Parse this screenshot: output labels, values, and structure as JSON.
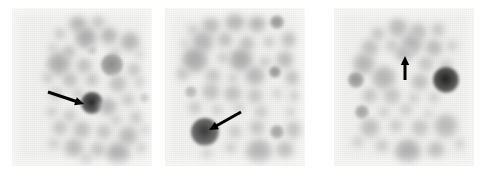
{
  "figure": {
    "kind": "autoradiograph-colony-blot",
    "width": 486,
    "height": 175,
    "background_color": "#ffffff",
    "panel_background_color": "#f2f2f0",
    "spot_color": "#808080",
    "arrow_color": "#000000",
    "panel_count": 3
  },
  "panels": [
    {
      "id": "panel-1",
      "label": "",
      "x": 12,
      "y": 8,
      "width": 140,
      "height": 158,
      "arrow": {
        "name": "arrow-annotation-1",
        "direction": "right-down",
        "tail": [
          36,
          84
        ],
        "tip": [
          72,
          96
        ],
        "length": 38
      },
      "spots": [
        {
          "cx": 66,
          "cy": 16,
          "r": 9,
          "tone": 0.3,
          "blur": "soft"
        },
        {
          "cx": 86,
          "cy": 14,
          "r": 7,
          "tone": 0.24,
          "blur": "soft"
        },
        {
          "cx": 48,
          "cy": 26,
          "r": 6,
          "tone": 0.22,
          "blur": "soft"
        },
        {
          "cx": 74,
          "cy": 30,
          "r": 11,
          "tone": 0.34,
          "blur": "soft"
        },
        {
          "cx": 97,
          "cy": 28,
          "r": 9,
          "tone": 0.3,
          "blur": "soft"
        },
        {
          "cx": 118,
          "cy": 34,
          "r": 10,
          "tone": 0.3,
          "blur": "soft"
        },
        {
          "cx": 41,
          "cy": 40,
          "r": 5,
          "tone": 0.2,
          "blur": "soft"
        },
        {
          "cx": 57,
          "cy": 44,
          "r": 7,
          "tone": 0.26,
          "blur": "soft"
        },
        {
          "cx": 80,
          "cy": 42,
          "r": 5,
          "tone": 0.22,
          "blur": "sharp"
        },
        {
          "cx": 103,
          "cy": 45,
          "r": 6,
          "tone": 0.2,
          "blur": "soft"
        },
        {
          "cx": 128,
          "cy": 46,
          "r": 5,
          "tone": 0.18,
          "blur": "soft"
        },
        {
          "cx": 47,
          "cy": 56,
          "r": 12,
          "tone": 0.33,
          "blur": "soft"
        },
        {
          "cx": 72,
          "cy": 58,
          "r": 8,
          "tone": 0.26,
          "blur": "soft"
        },
        {
          "cx": 100,
          "cy": 57,
          "r": 11,
          "tone": 0.45,
          "blur": "sharp"
        },
        {
          "cx": 122,
          "cy": 62,
          "r": 7,
          "tone": 0.24,
          "blur": "soft"
        },
        {
          "cx": 36,
          "cy": 70,
          "r": 6,
          "tone": 0.22,
          "blur": "soft"
        },
        {
          "cx": 58,
          "cy": 72,
          "r": 8,
          "tone": 0.26,
          "blur": "soft"
        },
        {
          "cx": 80,
          "cy": 72,
          "r": 7,
          "tone": 0.24,
          "blur": "soft"
        },
        {
          "cx": 106,
          "cy": 76,
          "r": 9,
          "tone": 0.26,
          "blur": "soft"
        },
        {
          "cx": 128,
          "cy": 74,
          "r": 6,
          "tone": 0.2,
          "blur": "soft"
        },
        {
          "cx": 44,
          "cy": 86,
          "r": 7,
          "tone": 0.22,
          "blur": "soft"
        },
        {
          "cx": 66,
          "cy": 86,
          "r": 6,
          "tone": 0.22,
          "blur": "soft"
        },
        {
          "cx": 80,
          "cy": 95,
          "r": 11,
          "tone": 0.85,
          "blur": "sharp"
        },
        {
          "cx": 96,
          "cy": 99,
          "r": 9,
          "tone": 0.3,
          "blur": "soft"
        },
        {
          "cx": 116,
          "cy": 92,
          "r": 7,
          "tone": 0.22,
          "blur": "soft"
        },
        {
          "cx": 133,
          "cy": 90,
          "r": 5,
          "tone": 0.24,
          "blur": "sharp"
        },
        {
          "cx": 40,
          "cy": 104,
          "r": 6,
          "tone": 0.2,
          "blur": "soft"
        },
        {
          "cx": 58,
          "cy": 108,
          "r": 7,
          "tone": 0.22,
          "blur": "soft"
        },
        {
          "cx": 104,
          "cy": 112,
          "r": 6,
          "tone": 0.2,
          "blur": "soft"
        },
        {
          "cx": 124,
          "cy": 110,
          "r": 7,
          "tone": 0.22,
          "blur": "soft"
        },
        {
          "cx": 48,
          "cy": 120,
          "r": 8,
          "tone": 0.24,
          "blur": "soft"
        },
        {
          "cx": 70,
          "cy": 122,
          "r": 9,
          "tone": 0.26,
          "blur": "soft"
        },
        {
          "cx": 92,
          "cy": 124,
          "r": 8,
          "tone": 0.24,
          "blur": "soft"
        },
        {
          "cx": 116,
          "cy": 128,
          "r": 10,
          "tone": 0.28,
          "blur": "soft"
        },
        {
          "cx": 134,
          "cy": 122,
          "r": 6,
          "tone": 0.2,
          "blur": "soft"
        },
        {
          "cx": 42,
          "cy": 136,
          "r": 6,
          "tone": 0.2,
          "blur": "soft"
        },
        {
          "cx": 62,
          "cy": 140,
          "r": 10,
          "tone": 0.28,
          "blur": "soft"
        },
        {
          "cx": 86,
          "cy": 142,
          "r": 8,
          "tone": 0.24,
          "blur": "soft"
        },
        {
          "cx": 106,
          "cy": 146,
          "r": 12,
          "tone": 0.32,
          "blur": "soft"
        },
        {
          "cx": 130,
          "cy": 140,
          "r": 6,
          "tone": 0.2,
          "blur": "soft"
        },
        {
          "cx": 74,
          "cy": 152,
          "r": 7,
          "tone": 0.22,
          "blur": "soft"
        }
      ]
    },
    {
      "id": "panel-2",
      "label": "",
      "x": 165,
      "y": 8,
      "width": 140,
      "height": 158,
      "arrow": {
        "name": "arrow-annotation-2",
        "direction": "left-down",
        "tail": [
          76,
          104
        ],
        "tip": [
          44,
          122
        ],
        "length": 37
      },
      "spots": [
        {
          "cx": 28,
          "cy": 22,
          "r": 6,
          "tone": 0.2,
          "blur": "soft"
        },
        {
          "cx": 46,
          "cy": 18,
          "r": 9,
          "tone": 0.28,
          "blur": "soft"
        },
        {
          "cx": 70,
          "cy": 14,
          "r": 10,
          "tone": 0.3,
          "blur": "soft"
        },
        {
          "cx": 92,
          "cy": 16,
          "r": 9,
          "tone": 0.3,
          "blur": "soft"
        },
        {
          "cx": 112,
          "cy": 14,
          "r": 7,
          "tone": 0.42,
          "blur": "sharp"
        },
        {
          "cx": 20,
          "cy": 36,
          "r": 5,
          "tone": 0.18,
          "blur": "soft"
        },
        {
          "cx": 38,
          "cy": 34,
          "r": 11,
          "tone": 0.3,
          "blur": "soft"
        },
        {
          "cx": 60,
          "cy": 32,
          "r": 8,
          "tone": 0.26,
          "blur": "soft"
        },
        {
          "cx": 82,
          "cy": 36,
          "r": 8,
          "tone": 0.26,
          "blur": "soft"
        },
        {
          "cx": 104,
          "cy": 34,
          "r": 6,
          "tone": 0.22,
          "blur": "soft"
        },
        {
          "cx": 124,
          "cy": 32,
          "r": 8,
          "tone": 0.26,
          "blur": "soft"
        },
        {
          "cx": 30,
          "cy": 52,
          "r": 13,
          "tone": 0.34,
          "blur": "soft"
        },
        {
          "cx": 58,
          "cy": 50,
          "r": 6,
          "tone": 0.22,
          "blur": "soft"
        },
        {
          "cx": 76,
          "cy": 52,
          "r": 12,
          "tone": 0.34,
          "blur": "soft"
        },
        {
          "cx": 100,
          "cy": 54,
          "r": 6,
          "tone": 0.22,
          "blur": "soft"
        },
        {
          "cx": 120,
          "cy": 52,
          "r": 9,
          "tone": 0.28,
          "blur": "soft"
        },
        {
          "cx": 18,
          "cy": 66,
          "r": 7,
          "tone": 0.24,
          "blur": "soft"
        },
        {
          "cx": 48,
          "cy": 68,
          "r": 8,
          "tone": 0.24,
          "blur": "soft"
        },
        {
          "cx": 68,
          "cy": 70,
          "r": 6,
          "tone": 0.2,
          "blur": "soft"
        },
        {
          "cx": 90,
          "cy": 68,
          "r": 10,
          "tone": 0.3,
          "blur": "soft"
        },
        {
          "cx": 110,
          "cy": 64,
          "r": 6,
          "tone": 0.42,
          "blur": "sharp"
        },
        {
          "cx": 128,
          "cy": 70,
          "r": 8,
          "tone": 0.26,
          "blur": "soft"
        },
        {
          "cx": 26,
          "cy": 84,
          "r": 6,
          "tone": 0.28,
          "blur": "sharp"
        },
        {
          "cx": 46,
          "cy": 84,
          "r": 9,
          "tone": 0.26,
          "blur": "soft"
        },
        {
          "cx": 68,
          "cy": 86,
          "r": 9,
          "tone": 0.26,
          "blur": "soft"
        },
        {
          "cx": 90,
          "cy": 88,
          "r": 8,
          "tone": 0.24,
          "blur": "soft"
        },
        {
          "cx": 112,
          "cy": 86,
          "r": 5,
          "tone": 0.2,
          "blur": "soft"
        },
        {
          "cx": 130,
          "cy": 88,
          "r": 6,
          "tone": 0.22,
          "blur": "soft"
        },
        {
          "cx": 30,
          "cy": 100,
          "r": 7,
          "tone": 0.22,
          "blur": "soft"
        },
        {
          "cx": 52,
          "cy": 102,
          "r": 6,
          "tone": 0.2,
          "blur": "soft"
        },
        {
          "cx": 74,
          "cy": 100,
          "r": 6,
          "tone": 0.2,
          "blur": "soft"
        },
        {
          "cx": 96,
          "cy": 104,
          "r": 7,
          "tone": 0.22,
          "blur": "soft"
        },
        {
          "cx": 126,
          "cy": 104,
          "r": 5,
          "tone": 0.2,
          "blur": "soft"
        },
        {
          "cx": 40,
          "cy": 124,
          "r": 14,
          "tone": 0.78,
          "blur": "sharp"
        },
        {
          "cx": 70,
          "cy": 124,
          "r": 7,
          "tone": 0.22,
          "blur": "soft"
        },
        {
          "cx": 92,
          "cy": 120,
          "r": 8,
          "tone": 0.24,
          "blur": "soft"
        },
        {
          "cx": 112,
          "cy": 124,
          "r": 7,
          "tone": 0.36,
          "blur": "sharp"
        },
        {
          "cx": 130,
          "cy": 122,
          "r": 9,
          "tone": 0.26,
          "blur": "soft"
        },
        {
          "cx": 66,
          "cy": 140,
          "r": 6,
          "tone": 0.2,
          "blur": "soft"
        },
        {
          "cx": 94,
          "cy": 144,
          "r": 13,
          "tone": 0.3,
          "blur": "soft"
        },
        {
          "cx": 120,
          "cy": 142,
          "r": 9,
          "tone": 0.26,
          "blur": "soft"
        },
        {
          "cx": 42,
          "cy": 146,
          "r": 6,
          "tone": 0.18,
          "blur": "soft"
        }
      ]
    },
    {
      "id": "panel-3",
      "label": "",
      "x": 334,
      "y": 8,
      "width": 140,
      "height": 158,
      "arrow": {
        "name": "arrow-annotation-3",
        "direction": "up",
        "tail": [
          71,
          72
        ],
        "tip": [
          71,
          48
        ],
        "length": 24
      },
      "spots": [
        {
          "cx": 44,
          "cy": 26,
          "r": 7,
          "tone": 0.24,
          "blur": "soft"
        },
        {
          "cx": 64,
          "cy": 20,
          "r": 10,
          "tone": 0.28,
          "blur": "soft"
        },
        {
          "cx": 84,
          "cy": 24,
          "r": 9,
          "tone": 0.26,
          "blur": "soft"
        },
        {
          "cx": 104,
          "cy": 22,
          "r": 7,
          "tone": 0.24,
          "blur": "soft"
        },
        {
          "cx": 36,
          "cy": 40,
          "r": 9,
          "tone": 0.26,
          "blur": "soft"
        },
        {
          "cx": 58,
          "cy": 38,
          "r": 7,
          "tone": 0.22,
          "blur": "soft"
        },
        {
          "cx": 78,
          "cy": 36,
          "r": 11,
          "tone": 0.3,
          "blur": "soft"
        },
        {
          "cx": 100,
          "cy": 40,
          "r": 9,
          "tone": 0.28,
          "blur": "soft"
        },
        {
          "cx": 118,
          "cy": 38,
          "r": 6,
          "tone": 0.2,
          "blur": "soft"
        },
        {
          "cx": 30,
          "cy": 56,
          "r": 11,
          "tone": 0.3,
          "blur": "soft"
        },
        {
          "cx": 70,
          "cy": 46,
          "r": 9,
          "tone": 0.28,
          "blur": "soft"
        },
        {
          "cx": 92,
          "cy": 56,
          "r": 8,
          "tone": 0.24,
          "blur": "soft"
        },
        {
          "cx": 112,
          "cy": 58,
          "r": 7,
          "tone": 0.22,
          "blur": "soft"
        },
        {
          "cx": 22,
          "cy": 72,
          "r": 8,
          "tone": 0.42,
          "blur": "sharp"
        },
        {
          "cx": 50,
          "cy": 70,
          "r": 12,
          "tone": 0.3,
          "blur": "soft"
        },
        {
          "cx": 86,
          "cy": 74,
          "r": 9,
          "tone": 0.26,
          "blur": "soft"
        },
        {
          "cx": 112,
          "cy": 72,
          "r": 13,
          "tone": 0.88,
          "blur": "sharp"
        },
        {
          "cx": 36,
          "cy": 88,
          "r": 8,
          "tone": 0.24,
          "blur": "soft"
        },
        {
          "cx": 58,
          "cy": 88,
          "r": 9,
          "tone": 0.24,
          "blur": "soft"
        },
        {
          "cx": 80,
          "cy": 90,
          "r": 6,
          "tone": 0.2,
          "blur": "soft"
        },
        {
          "cx": 100,
          "cy": 90,
          "r": 6,
          "tone": 0.2,
          "blur": "soft"
        },
        {
          "cx": 28,
          "cy": 104,
          "r": 7,
          "tone": 0.36,
          "blur": "sharp"
        },
        {
          "cx": 50,
          "cy": 104,
          "r": 6,
          "tone": 0.2,
          "blur": "soft"
        },
        {
          "cx": 72,
          "cy": 102,
          "r": 7,
          "tone": 0.2,
          "blur": "soft"
        },
        {
          "cx": 94,
          "cy": 106,
          "r": 5,
          "tone": 0.18,
          "blur": "soft"
        },
        {
          "cx": 36,
          "cy": 120,
          "r": 10,
          "tone": 0.26,
          "blur": "soft"
        },
        {
          "cx": 62,
          "cy": 118,
          "r": 7,
          "tone": 0.22,
          "blur": "soft"
        },
        {
          "cx": 86,
          "cy": 120,
          "r": 9,
          "tone": 0.24,
          "blur": "soft"
        },
        {
          "cx": 112,
          "cy": 118,
          "r": 12,
          "tone": 0.28,
          "blur": "soft"
        },
        {
          "cx": 24,
          "cy": 134,
          "r": 6,
          "tone": 0.2,
          "blur": "soft"
        },
        {
          "cx": 48,
          "cy": 138,
          "r": 7,
          "tone": 0.22,
          "blur": "soft"
        },
        {
          "cx": 74,
          "cy": 144,
          "r": 13,
          "tone": 0.32,
          "blur": "soft"
        },
        {
          "cx": 102,
          "cy": 142,
          "r": 9,
          "tone": 0.26,
          "blur": "soft"
        },
        {
          "cx": 126,
          "cy": 136,
          "r": 6,
          "tone": 0.18,
          "blur": "soft"
        }
      ]
    }
  ]
}
